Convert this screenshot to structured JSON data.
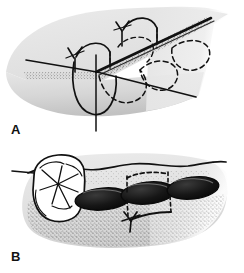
{
  "figure": {
    "background_color": "#ffffff",
    "ink_color": "#111111",
    "tissue_fill": "#e2e2e2",
    "tissue_fill_light": "#efefef",
    "tissue_shadow": "#c9c9c9",
    "socket_dark": "#151515",
    "width": 244,
    "height": 273
  },
  "panels": [
    {
      "id": "panel-a",
      "label": "A",
      "caption": "Three-dimensional view of alveolar ridge with crestal incision",
      "elements": {
        "ridge_body": "alveolar-ridge-block",
        "incision_line": "crestal-incision",
        "stipple_band": "papilla-stipple-band",
        "solid_socket": "near-tooth-socket-outline",
        "dashed_sockets": "buried-socket-outlines",
        "sutures": [
          {
            "name": "suture-knot-left",
            "x": 74,
            "y": 58
          },
          {
            "name": "suture-knot-upper",
            "x": 122,
            "y": 30
          }
        ],
        "vertical_axis": "root-axis-line"
      }
    },
    {
      "id": "panel-b",
      "label": "B",
      "caption": "Buccal view showing molar, extraction sockets and suture knot",
      "elements": {
        "gingiva_body": "gingiva-outline",
        "crest_line": "gingival-crest-line",
        "molar": "molar-occlusal-view",
        "sockets": [
          {
            "name": "socket-oval-left",
            "cx": 103,
            "cy": 199
          },
          {
            "name": "socket-oval-middle",
            "cx": 147,
            "cy": 194
          },
          {
            "name": "socket-oval-right",
            "cx": 192,
            "cy": 190
          }
        ],
        "suture_upper": "suture-span-upper",
        "suture_lower": "suture-span-lower",
        "knot": {
          "name": "suture-knot-center",
          "x": 132,
          "y": 225
        },
        "stipple_field": "attached-gingiva-stipple"
      }
    }
  ]
}
